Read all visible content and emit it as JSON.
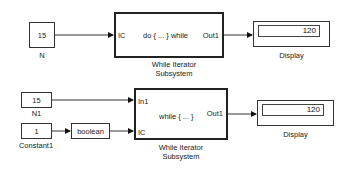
{
  "diagram1": {
    "constant": {
      "value": "15",
      "label": "N"
    },
    "subsystem": {
      "in_port": "IC",
      "mode": "do { ... } while",
      "out_port": "Out1",
      "label_line1": "While Iterator",
      "label_line2": "Subsystem"
    },
    "display": {
      "value": "120",
      "label": "Display"
    }
  },
  "diagram2": {
    "constant_n1": {
      "value": "15",
      "label": "N1"
    },
    "constant1": {
      "value": "1",
      "label": "Constant1"
    },
    "conversion": {
      "label": "boolean"
    },
    "subsystem": {
      "in_port1": "In1",
      "in_port2": "IC",
      "mode": "while { ... }",
      "out_port": "Out1",
      "label_line1": "While Iterator",
      "label_line2": "Subsystem"
    },
    "display": {
      "value": "120",
      "label": "Display"
    }
  }
}
